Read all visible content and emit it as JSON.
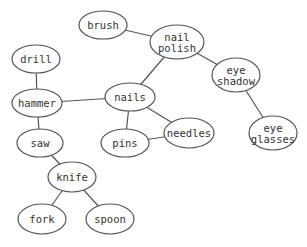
{
  "diagram": {
    "type": "graph",
    "nodes": [
      {
        "id": "brush",
        "lines": [
          "brush"
        ],
        "cx": 103,
        "cy": 25,
        "rx": 24,
        "ry": 14
      },
      {
        "id": "nail_polish",
        "lines": [
          "nail",
          "polish"
        ],
        "cx": 177,
        "cy": 42,
        "rx": 27,
        "ry": 17
      },
      {
        "id": "drill",
        "lines": [
          "drill"
        ],
        "cx": 36,
        "cy": 59,
        "rx": 24,
        "ry": 14
      },
      {
        "id": "eye_shadow",
        "lines": [
          "eye",
          "shadow"
        ],
        "cx": 236,
        "cy": 75,
        "rx": 24,
        "ry": 17
      },
      {
        "id": "hammer",
        "lines": [
          "hammer"
        ],
        "cx": 37,
        "cy": 103,
        "rx": 25,
        "ry": 14
      },
      {
        "id": "nails",
        "lines": [
          "nails"
        ],
        "cx": 130,
        "cy": 97,
        "rx": 25,
        "ry": 14
      },
      {
        "id": "saw",
        "lines": [
          "saw"
        ],
        "cx": 40,
        "cy": 143,
        "rx": 23,
        "ry": 14
      },
      {
        "id": "pins",
        "lines": [
          "pins"
        ],
        "cx": 125,
        "cy": 143,
        "rx": 24,
        "ry": 14
      },
      {
        "id": "needles",
        "lines": [
          "needles"
        ],
        "cx": 189,
        "cy": 133,
        "rx": 25,
        "ry": 15
      },
      {
        "id": "eye_glasses",
        "lines": [
          "eye",
          "glasses"
        ],
        "cx": 273,
        "cy": 133,
        "rx": 24,
        "ry": 17
      },
      {
        "id": "knife",
        "lines": [
          "knife"
        ],
        "cx": 72,
        "cy": 177,
        "rx": 24,
        "ry": 15
      },
      {
        "id": "fork",
        "lines": [
          "fork"
        ],
        "cx": 42,
        "cy": 219,
        "rx": 24,
        "ry": 15
      },
      {
        "id": "spoon",
        "lines": [
          "spoon"
        ],
        "cx": 110,
        "cy": 219,
        "rx": 24,
        "ry": 15
      }
    ],
    "edges": [
      [
        "brush",
        "nail_polish"
      ],
      [
        "nail_polish",
        "eye_shadow"
      ],
      [
        "nail_polish",
        "nails"
      ],
      [
        "eye_shadow",
        "eye_glasses"
      ],
      [
        "drill",
        "hammer"
      ],
      [
        "hammer",
        "nails"
      ],
      [
        "hammer",
        "saw"
      ],
      [
        "nails",
        "pins"
      ],
      [
        "nails",
        "needles"
      ],
      [
        "pins",
        "needles"
      ],
      [
        "saw",
        "knife"
      ],
      [
        "knife",
        "fork"
      ],
      [
        "knife",
        "spoon"
      ]
    ]
  }
}
